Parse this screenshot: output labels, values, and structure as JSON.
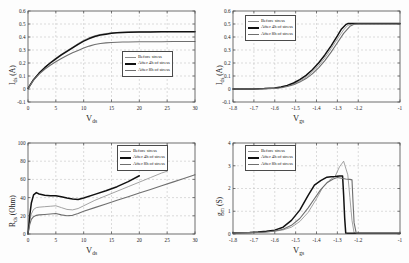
{
  "figure": {
    "background": "#fdfdfd",
    "axis_color": "#4a4a4a",
    "grid_color": "#b9b9b9"
  },
  "legend": {
    "entries": [
      {
        "label": "Before stress",
        "color": "#8c8c8c",
        "width": 0.8
      },
      {
        "label": "After 4h of stress",
        "color": "#111111",
        "width": 1.5
      },
      {
        "label": "After 8h of stress",
        "color": "#6f6f6f",
        "width": 1.1
      }
    ]
  },
  "chart_data": [
    {
      "id": "ids-vds",
      "type": "line",
      "title": "",
      "xlabel": "V_ds",
      "ylabel": "I_ds (A)",
      "xlim": [
        0,
        30
      ],
      "ylim": [
        -0.1,
        0.6
      ],
      "xticks": [
        0,
        5,
        10,
        15,
        20,
        25,
        30
      ],
      "yticks": [
        -0.1,
        0,
        0.1,
        0.2,
        0.3,
        0.4,
        0.5,
        0.6
      ],
      "xticklabels": [
        "0",
        "5",
        "10",
        "15",
        "20",
        "25",
        "30"
      ],
      "yticklabels": [
        "-0.1",
        "0",
        "0.1",
        "0.2",
        "0.3",
        "0.4",
        "0.5",
        "0.6"
      ],
      "grid": true,
      "legend_position": "lower-right",
      "series": [
        {
          "name": "Before stress",
          "x": [
            0,
            1,
            2,
            3,
            4,
            5,
            6,
            7,
            8,
            9,
            10,
            11,
            12,
            13,
            14,
            15,
            16,
            17,
            18,
            20,
            22,
            24,
            26,
            28,
            30
          ],
          "y": [
            0.005,
            0.075,
            0.125,
            0.168,
            0.205,
            0.238,
            0.268,
            0.295,
            0.322,
            0.35,
            0.375,
            0.395,
            0.41,
            0.42,
            0.427,
            0.432,
            0.435,
            0.437,
            0.438,
            0.44,
            0.441,
            0.441,
            0.442,
            0.442,
            0.442
          ]
        },
        {
          "name": "After 4h of stress",
          "x": [
            0,
            1,
            2,
            3,
            4,
            5,
            6,
            7,
            8,
            9,
            10,
            11,
            12,
            13,
            14,
            15,
            16,
            17,
            18,
            20,
            22,
            24,
            26,
            28,
            30
          ],
          "y": [
            0.004,
            0.072,
            0.122,
            0.164,
            0.2,
            0.232,
            0.262,
            0.29,
            0.317,
            0.344,
            0.368,
            0.388,
            0.404,
            0.415,
            0.422,
            0.428,
            0.432,
            0.434,
            0.436,
            0.438,
            0.439,
            0.44,
            0.44,
            0.441,
            0.441
          ]
        },
        {
          "name": "After 8h of stress",
          "x": [
            0,
            1,
            2,
            3,
            4,
            5,
            6,
            7,
            8,
            9,
            10,
            11,
            12,
            13,
            14,
            15,
            16,
            17,
            18,
            20,
            22,
            24,
            26,
            28,
            30
          ],
          "y": [
            0.003,
            0.068,
            0.115,
            0.152,
            0.183,
            0.21,
            0.235,
            0.257,
            0.278,
            0.297,
            0.315,
            0.33,
            0.342,
            0.35,
            0.355,
            0.358,
            0.36,
            0.361,
            0.362,
            0.363,
            0.364,
            0.364,
            0.365,
            0.365,
            0.365
          ]
        }
      ]
    },
    {
      "id": "ids-vgs",
      "type": "line",
      "title": "",
      "xlabel": "V_gs",
      "ylabel": "I_ds (A)",
      "xlim": [
        -1.8,
        -1.0
      ],
      "ylim": [
        -0.1,
        0.6
      ],
      "xticks": [
        -1.8,
        -1.7,
        -1.6,
        -1.5,
        -1.4,
        -1.3,
        -1.2,
        -1.0
      ],
      "yticks": [
        -0.1,
        0,
        0.1,
        0.2,
        0.3,
        0.4,
        0.5,
        0.6
      ],
      "xticklabels": [
        "-1.8",
        "-1.7",
        "-1.6",
        "-1.5",
        "-1.4",
        "-1.3",
        "-1.2",
        "-1"
      ],
      "yticklabels": [
        "-0.1",
        "0",
        "0.1",
        "0.2",
        "0.3",
        "0.4",
        "0.5",
        "0.6"
      ],
      "grid": true,
      "legend_position": "upper-left",
      "series": [
        {
          "name": "Before stress",
          "x": [
            -1.8,
            -1.7,
            -1.65,
            -1.6,
            -1.57,
            -1.54,
            -1.51,
            -1.48,
            -1.45,
            -1.42,
            -1.39,
            -1.36,
            -1.33,
            -1.3,
            -1.27,
            -1.25,
            -1.23,
            -1.2,
            -1.0
          ],
          "y": [
            0.0,
            0.0,
            0.002,
            0.006,
            0.012,
            0.022,
            0.038,
            0.06,
            0.09,
            0.13,
            0.18,
            0.24,
            0.31,
            0.385,
            0.455,
            0.49,
            0.5,
            0.5,
            0.5
          ]
        },
        {
          "name": "After 4h of stress",
          "x": [
            -1.8,
            -1.7,
            -1.65,
            -1.6,
            -1.57,
            -1.54,
            -1.51,
            -1.48,
            -1.45,
            -1.42,
            -1.39,
            -1.36,
            -1.33,
            -1.3,
            -1.28,
            -1.26,
            -1.25,
            -1.2,
            -1.0
          ],
          "y": [
            0.0,
            0.0,
            0.003,
            0.008,
            0.016,
            0.028,
            0.046,
            0.072,
            0.105,
            0.148,
            0.2,
            0.262,
            0.332,
            0.408,
            0.462,
            0.495,
            0.503,
            0.503,
            0.503
          ]
        },
        {
          "name": "After 8h of stress",
          "x": [
            -1.8,
            -1.7,
            -1.65,
            -1.6,
            -1.57,
            -1.54,
            -1.51,
            -1.48,
            -1.45,
            -1.42,
            -1.39,
            -1.36,
            -1.33,
            -1.3,
            -1.27,
            -1.24,
            -1.22,
            -1.2,
            -1.0
          ],
          "y": [
            0.0,
            0.0,
            0.002,
            0.005,
            0.01,
            0.019,
            0.033,
            0.053,
            0.08,
            0.116,
            0.162,
            0.218,
            0.284,
            0.356,
            0.428,
            0.482,
            0.498,
            0.5,
            0.5
          ]
        }
      ]
    },
    {
      "id": "rds-vds",
      "type": "line",
      "title": "",
      "xlabel": "V_ds",
      "ylabel": "R_ds (Ohm)",
      "xlim": [
        0,
        30
      ],
      "ylim": [
        0,
        100
      ],
      "xticks": [
        0,
        5,
        10,
        15,
        20,
        25,
        30
      ],
      "yticks": [
        0,
        20,
        40,
        60,
        80,
        100
      ],
      "xticklabels": [
        "0",
        "5",
        "10",
        "15",
        "20",
        "25",
        "30"
      ],
      "yticklabels": [
        "0",
        "20",
        "40",
        "60",
        "80",
        "100"
      ],
      "grid": true,
      "legend_position": "upper-right",
      "series": [
        {
          "name": "Before stress",
          "x": [
            0,
            0.3,
            0.6,
            1.0,
            1.5,
            2,
            3,
            4,
            5,
            6,
            7,
            8,
            9,
            10,
            12,
            14,
            16,
            18,
            20,
            22,
            24,
            25
          ],
          "y": [
            0,
            14,
            22,
            27,
            29,
            29.5,
            30,
            30.5,
            31,
            29,
            27,
            26.5,
            28,
            31,
            37,
            42,
            47,
            52,
            57,
            62,
            67,
            69
          ]
        },
        {
          "name": "After 4h of stress",
          "x": [
            0,
            0.3,
            0.6,
            1.0,
            1.5,
            2,
            3,
            4,
            5,
            6,
            7,
            8,
            9,
            10,
            12,
            14,
            16,
            18,
            20
          ],
          "y": [
            0,
            20,
            34,
            43,
            45.5,
            44,
            42.5,
            42,
            42,
            41,
            39.5,
            38.5,
            38,
            39.5,
            43.5,
            47.5,
            52,
            57.5,
            64
          ]
        },
        {
          "name": "After 8h of stress",
          "x": [
            0,
            0.3,
            0.6,
            1.0,
            1.5,
            2,
            3,
            4,
            5,
            6,
            7,
            8,
            9,
            10,
            12,
            14,
            16,
            18,
            20,
            22,
            24,
            26,
            28,
            30
          ],
          "y": [
            0,
            10,
            16,
            19,
            20.5,
            21,
            21.5,
            22,
            22.5,
            21,
            20,
            20.5,
            22.5,
            25,
            29,
            33,
            37,
            41,
            45,
            49,
            53,
            57,
            61,
            65
          ]
        }
      ]
    },
    {
      "id": "gm-vgs",
      "type": "line",
      "title": "",
      "xlabel": "V_gs",
      "ylabel": "g_m (S)",
      "xlim": [
        -1.8,
        -1.0
      ],
      "ylim": [
        0,
        4
      ],
      "xticks": [
        -1.8,
        -1.7,
        -1.6,
        -1.5,
        -1.4,
        -1.3,
        -1.2,
        -1.0
      ],
      "yticks": [
        0,
        1,
        2,
        3,
        4
      ],
      "xticklabels": [
        "-1.8",
        "-1.7",
        "-1.6",
        "-1.5",
        "-1.4",
        "-1.3",
        "-1.2",
        "-1"
      ],
      "yticklabels": [
        "0",
        "1",
        "2",
        "3",
        "4"
      ],
      "grid": true,
      "legend_position": "upper-left",
      "series": [
        {
          "name": "Before stress",
          "x": [
            -1.8,
            -1.72,
            -1.68,
            -1.64,
            -1.6,
            -1.56,
            -1.52,
            -1.48,
            -1.44,
            -1.4,
            -1.37,
            -1.34,
            -1.31,
            -1.29,
            -1.27,
            -1.25,
            -1.24,
            -1.23,
            -1.22,
            -1.21,
            -1.2,
            -1.0
          ],
          "y": [
            0.05,
            0.06,
            0.08,
            0.09,
            0.12,
            0.18,
            0.3,
            0.55,
            0.95,
            1.55,
            2.05,
            2.35,
            2.55,
            2.95,
            3.2,
            2.6,
            1.6,
            0.6,
            0.05,
            0.03,
            0.02,
            0.02
          ]
        },
        {
          "name": "After 4h of stress",
          "x": [
            -1.8,
            -1.72,
            -1.68,
            -1.64,
            -1.6,
            -1.56,
            -1.52,
            -1.48,
            -1.44,
            -1.41,
            -1.38,
            -1.35,
            -1.33,
            -1.31,
            -1.29,
            -1.275,
            -1.27,
            -1.265,
            -1.26,
            -1.25,
            -1.2,
            -1.0
          ],
          "y": [
            0.06,
            0.07,
            0.09,
            0.12,
            0.17,
            0.3,
            0.6,
            1.05,
            1.7,
            2.15,
            2.35,
            2.5,
            2.52,
            2.53,
            2.55,
            2.55,
            1.7,
            0.7,
            0.04,
            0.03,
            0.03,
            0.03
          ]
        },
        {
          "name": "After 8h of stress",
          "x": [
            -1.8,
            -1.72,
            -1.68,
            -1.64,
            -1.6,
            -1.56,
            -1.52,
            -1.48,
            -1.44,
            -1.41,
            -1.38,
            -1.35,
            -1.32,
            -1.3,
            -1.28,
            -1.26,
            -1.24,
            -1.23,
            -1.225,
            -1.22,
            -1.21,
            -1.2,
            -1.0
          ],
          "y": [
            0.05,
            0.06,
            0.07,
            0.09,
            0.13,
            0.21,
            0.38,
            0.68,
            1.15,
            1.55,
            1.95,
            2.25,
            2.42,
            2.48,
            2.45,
            2.42,
            2.4,
            2.38,
            1.4,
            0.5,
            0.05,
            0.04,
            0.04
          ]
        }
      ]
    }
  ]
}
